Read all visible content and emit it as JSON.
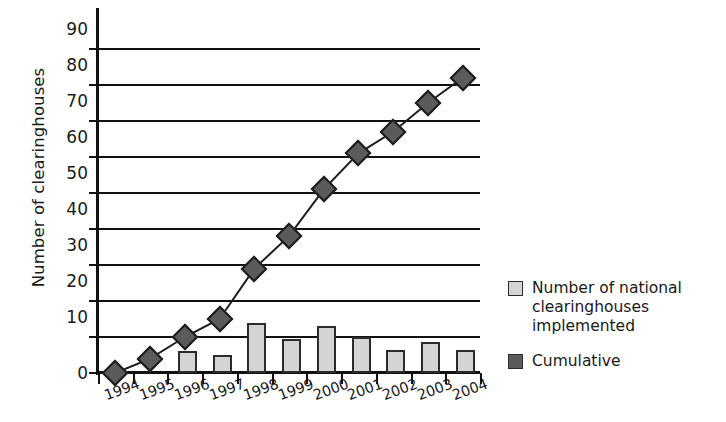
{
  "chart_data": {
    "type": "bar",
    "title": "",
    "xlabel": "",
    "ylabel": "Number of clearinghouses",
    "ylim": [
      0,
      90
    ],
    "yticks": [
      0,
      10,
      20,
      30,
      40,
      50,
      60,
      70,
      80,
      90
    ],
    "grid": true,
    "legend_position": "right",
    "categories": [
      "1994",
      "1995",
      "1996",
      "1997",
      "1998",
      "1999",
      "2000",
      "2001",
      "2002",
      "2003",
      "2004"
    ],
    "series": [
      {
        "name": "Number of national clearinghouses implemented",
        "type": "bar",
        "color": "#d4d4d4",
        "values": [
          0,
          0,
          6,
          5,
          14,
          9.5,
          13,
          10,
          6.5,
          8.5,
          6.5
        ]
      },
      {
        "name": "Cumulative",
        "type": "line",
        "color": "#5b5b5b",
        "marker": "diamond",
        "values": [
          0,
          4,
          10,
          15,
          29,
          38,
          51,
          61,
          67,
          75,
          82
        ]
      }
    ]
  },
  "axis": {
    "y_label": "Number of clearinghouses",
    "y_tick_labels": [
      "90",
      "80",
      "70",
      "60",
      "50",
      "40",
      "30",
      "20",
      "10",
      "0"
    ],
    "x_tick_labels": [
      "1994",
      "1995",
      "1996",
      "1997",
      "1998",
      "1999",
      "2000",
      "2001",
      "2002",
      "2003",
      "2004"
    ]
  },
  "legend": {
    "items": [
      {
        "label": "Number of national clearinghouses implemented",
        "swatch": "light-gray-square"
      },
      {
        "label": "Cumulative",
        "swatch": "dark-gray-square"
      }
    ]
  },
  "colors": {
    "bar_fill": "#d4d4d4",
    "bar_stroke": "#2b2b2b",
    "marker_fill": "#5b5b5b",
    "marker_stroke": "#1d1d1d",
    "axis": "#111111",
    "background": "#ffffff"
  }
}
